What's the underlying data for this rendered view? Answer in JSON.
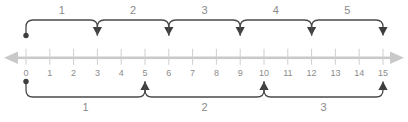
{
  "figure": {
    "background_color": "#ffffff"
  },
  "chart_data": {
    "type": "line",
    "title": "",
    "subtitle": "",
    "xlabel": "",
    "ylabel": "",
    "grid": false,
    "legend_position": "none",
    "axis": {
      "orientation": "horizontal",
      "min": 0,
      "max": 15,
      "tick_step": 1,
      "tick_labels": [
        "0",
        "1",
        "2",
        "3",
        "4",
        "5",
        "6",
        "7",
        "8",
        "9",
        "10",
        "11",
        "12",
        "13",
        "14",
        "15"
      ],
      "tick_values": [
        0,
        1,
        2,
        3,
        4,
        5,
        6,
        7,
        8,
        9,
        10,
        11,
        12,
        13,
        14,
        15
      ],
      "has_left_arrow": true,
      "has_right_arrow": true,
      "line_color": "#c9c9c9",
      "tick_color": "#cfcfcf",
      "label_color": "#8c8c8c"
    },
    "jumps_above": {
      "placement": "above",
      "jump_size": 3,
      "arrow_direction": "down",
      "start_marker": "dot",
      "color": "#3d3d3d",
      "label_color": "#8a8a8a",
      "items": [
        {
          "label": "1",
          "from": 0,
          "to": 3
        },
        {
          "label": "2",
          "from": 3,
          "to": 6
        },
        {
          "label": "3",
          "from": 6,
          "to": 9
        },
        {
          "label": "4",
          "from": 9,
          "to": 12
        },
        {
          "label": "5",
          "from": 12,
          "to": 15
        }
      ]
    },
    "jumps_below": {
      "placement": "below",
      "jump_size": 5,
      "arrow_direction": "up",
      "start_marker": "dot",
      "color": "#3d3d3d",
      "label_color": "#8a8a8a",
      "items": [
        {
          "label": "1",
          "from": 0,
          "to": 5
        },
        {
          "label": "2",
          "from": 5,
          "to": 10
        },
        {
          "label": "3",
          "from": 10,
          "to": 15
        }
      ]
    }
  }
}
